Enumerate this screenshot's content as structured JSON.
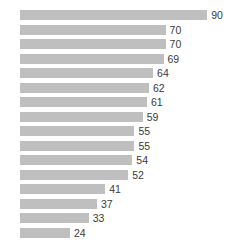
{
  "chart_data": {
    "type": "bar",
    "orientation": "horizontal",
    "title": "",
    "subtitle": "",
    "xlabel": "",
    "ylabel": "",
    "categories": [
      "",
      "",
      "",
      "",
      "",
      "",
      "",
      "",
      "",
      "",
      "",
      "",
      "",
      "",
      "",
      ""
    ],
    "values": [
      90,
      70,
      70,
      69,
      64,
      62,
      61,
      59,
      55,
      55,
      54,
      52,
      41,
      37,
      33,
      24
    ],
    "labels": [
      "90",
      "70",
      "70",
      "69",
      "64",
      "62",
      "61",
      "59",
      "55",
      "55",
      "54",
      "52",
      "41",
      "37",
      "33",
      "24"
    ],
    "data_labels_shown": true,
    "data_label_position": "outside-end",
    "xlim": [
      0,
      90
    ],
    "ylim": null,
    "grid": false,
    "legend": false,
    "legend_position": "none",
    "axis_visible": false,
    "tick_labels_visible": false,
    "sorted": "descending",
    "series": [
      {
        "name": "",
        "values": [
          90,
          70,
          70,
          69,
          64,
          62,
          61,
          59,
          55,
          55,
          54,
          52,
          41,
          37,
          33,
          24
        ]
      }
    ]
  },
  "style": {
    "bar_color": "#bfbfbf",
    "label_color": "#3a3a3a",
    "background_color": "#ffffff",
    "bar_height_px": 10,
    "row_pitch_px": 14.5,
    "plot_left_px": 20,
    "px_per_unit": 2.08,
    "top_margin_px": 8
  }
}
